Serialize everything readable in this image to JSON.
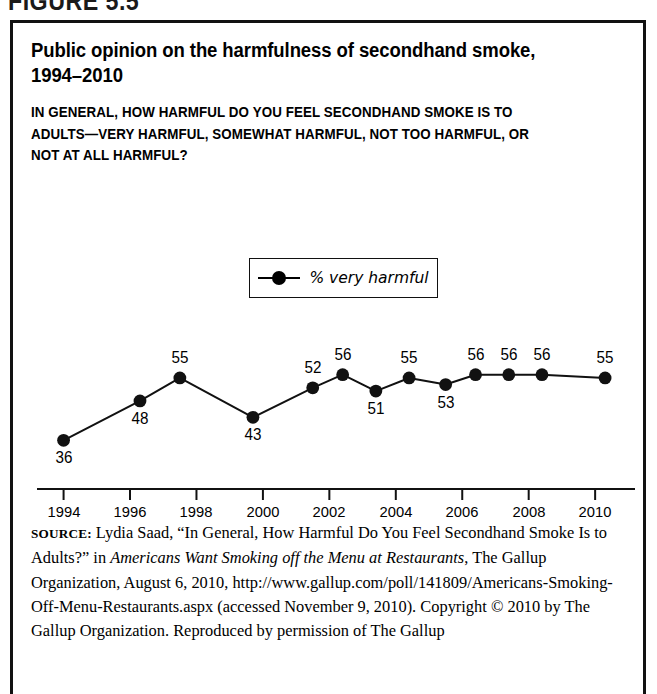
{
  "figure": {
    "header": "FIGURE 5.5",
    "title": "Public opinion on the harmfulness of secondhand smoke, 1994–2010",
    "subtitle": "IN GENERAL, HOW HARMFUL DO YOU FEEL SECONDHAND SMOKE IS TO ADULTS—VERY HARMFUL, SOMEWHAT HARMFUL, NOT TOO HARMFUL, OR NOT AT ALL HARMFUL?"
  },
  "source": {
    "label": "SOURCE:",
    "part1": " Lydia Saad, “In General, How Harmful Do You Feel Secondhand Smoke Is to Adults?” in ",
    "italic1": "Americans Want Smoking off the Menu at Restaurants",
    "part2": ", The Gallup Organization, August 6, 2010, http://www.gallup.com/poll/141809/Americans-Smoking-Off-Menu-Restaurants.aspx (accessed November 9, 2010). Copyright © 2010 by The Gallup Organization. Reproduced by permission of The Gallup"
  },
  "chart_data": {
    "type": "line",
    "title": "Public opinion on the harmfulness of secondhand smoke, 1994–2010",
    "xlabel": "",
    "ylabel": "",
    "legend": [
      "% very harmful"
    ],
    "legend_position": "top-center-inside",
    "grid": false,
    "x": [
      1994,
      1996.3,
      1997.5,
      1999.7,
      2001.5,
      2002.4,
      2003.4,
      2004.4,
      2005.5,
      2006.4,
      2007.4,
      2008.4,
      2010.3
    ],
    "categories": [
      "1994",
      "1996",
      "1997",
      "2000",
      "2001",
      "2002",
      "2003",
      "2004",
      "2005",
      "2006",
      "2007",
      "2008",
      "2010"
    ],
    "values": [
      36,
      48,
      55,
      43,
      52,
      56,
      51,
      55,
      53,
      56,
      56,
      56,
      55
    ],
    "label_positions": [
      "below",
      "below",
      "above",
      "below",
      "above",
      "above",
      "below",
      "above",
      "below",
      "above",
      "above",
      "above",
      "above"
    ],
    "series": [
      {
        "name": "% very harmful",
        "values": [
          36,
          48,
          55,
          43,
          52,
          56,
          51,
          55,
          53,
          56,
          56,
          56,
          55
        ]
      }
    ],
    "xlim": [
      1993.2,
      2011.2
    ],
    "ylim": [
      30,
      62
    ],
    "xticks": [
      "1994",
      "1996",
      "1998",
      "2000",
      "2002",
      "2004",
      "2006",
      "2008",
      "2010"
    ],
    "xtick_values": [
      1994,
      1996,
      1998,
      2000,
      2002,
      2004,
      2006,
      2008,
      2010
    ],
    "marker": "filled-circle",
    "line_color": "#000000",
    "marker_color": "#000000"
  }
}
